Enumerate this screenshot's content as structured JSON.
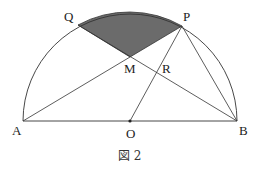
{
  "figure": {
    "caption": "図 2",
    "points": {
      "A": "A",
      "B": "B",
      "O": "O",
      "P": "P",
      "Q": "Q",
      "M": "M",
      "R": "R"
    },
    "colors": {
      "line": "#333333",
      "shade": "#6b6b6b"
    }
  }
}
